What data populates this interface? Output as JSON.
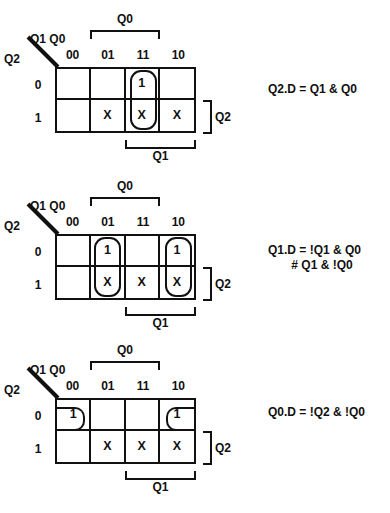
{
  "page": {
    "background_color": "#ffffff",
    "ink_color": "#111111"
  },
  "shared_labels": {
    "top_bracket": "Q0",
    "bottom_bracket": "Q1",
    "right_bracket": "Q2",
    "corner_top": "Q1 Q0",
    "corner_side": "Q2",
    "column_headers": [
      "00",
      "01",
      "11",
      "10"
    ],
    "row_headers": [
      "0",
      "1"
    ]
  },
  "kmaps": [
    {
      "name": "Q2.D",
      "cells": [
        [
          "",
          "",
          "1",
          ""
        ],
        [
          "",
          "X",
          "X",
          "X"
        ]
      ],
      "groups": [
        {
          "type": "vert",
          "column": 2,
          "rows": [
            0,
            1
          ]
        }
      ],
      "equation": "Q2.D = Q1 & Q0"
    },
    {
      "name": "Q1.D",
      "cells": [
        [
          "",
          "1",
          "",
          "1"
        ],
        [
          "",
          "X",
          "X",
          "X"
        ]
      ],
      "groups": [
        {
          "type": "vert",
          "column": 1,
          "rows": [
            0,
            1
          ]
        },
        {
          "type": "vert",
          "column": 3,
          "rows": [
            0,
            1
          ]
        }
      ],
      "equation": "Q1.D = !Q1 & Q0\n       # Q1 & !Q0"
    },
    {
      "name": "Q0.D",
      "cells": [
        [
          "1",
          "",
          "",
          "1"
        ],
        [
          "",
          "X",
          "X",
          "X"
        ]
      ],
      "groups": [
        {
          "type": "open-left",
          "column": 0,
          "row": 0
        },
        {
          "type": "open-right",
          "column": 3,
          "row": 0
        }
      ],
      "equation": "Q0.D = !Q2 & !Q0"
    }
  ]
}
